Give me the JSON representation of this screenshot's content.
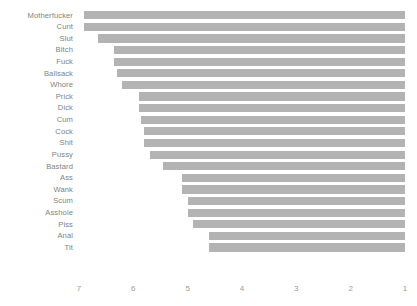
{
  "chart_data": {
    "type": "bar",
    "orientation": "horizontal",
    "title": "",
    "subtitle": "",
    "xlabel": "",
    "ylabel": "",
    "grid": false,
    "legend": false,
    "x_axis_reversed": true,
    "xlim": [
      7.4,
      0.85
    ],
    "xticks": [
      7,
      6,
      5,
      4,
      3,
      2,
      1
    ],
    "xtick_labels": [
      "7",
      "6",
      "5",
      "4",
      "3",
      "2",
      "1"
    ],
    "bar_baseline": 1,
    "bar_color": "#b3b3b3",
    "label_color": "#7f7f7f",
    "tick_color": "#9a9a9a",
    "background_color": "#ffffff",
    "categories": [
      "Motherfucker",
      "Cunt",
      "Slut",
      "Bitch",
      "Fuck",
      "Ballsack",
      "Whore",
      "Prick",
      "Dick",
      "Cum",
      "Cock",
      "Shit",
      "Pussy",
      "Bastard",
      "Ass",
      "Wank",
      "Scum",
      "Asshole",
      "Piss",
      "Anal",
      "Tit"
    ],
    "values": [
      6.9,
      6.9,
      6.65,
      6.35,
      6.35,
      6.3,
      6.2,
      5.9,
      5.9,
      5.85,
      5.8,
      5.8,
      5.7,
      5.45,
      5.1,
      5.1,
      5.0,
      5.0,
      4.9,
      4.6,
      4.6
    ]
  }
}
